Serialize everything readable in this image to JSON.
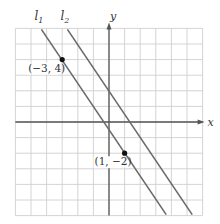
{
  "figure": {
    "type": "coordinate-plane",
    "grid": {
      "xmin": -6,
      "xmax": 6,
      "ymin": -6,
      "ymax": 6,
      "step": 1
    },
    "axes": {
      "x_label": "x",
      "y_label": "y"
    },
    "lines": [
      {
        "name": "l1",
        "label": "l",
        "subscript": "1",
        "slope": -1.5,
        "intercept": -0.5,
        "equation": "y = -3/2 x - 1/2"
      },
      {
        "name": "l2",
        "label": "l",
        "subscript": "2",
        "slope": -1.5,
        "intercept": 2,
        "equation": "y = -3/2 x + 2"
      }
    ],
    "points": [
      {
        "x": -3,
        "y": 4,
        "label": "(−3, 4)"
      },
      {
        "x": 1,
        "y": -2,
        "label": "(1, −2)"
      }
    ],
    "colors": {
      "grid": "#cfcfcf",
      "axis": "#555555",
      "line": "#6a6a6a",
      "point": "#111111",
      "text": "#333333"
    }
  }
}
